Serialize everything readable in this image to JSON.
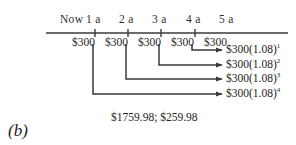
{
  "figure": {
    "panel_label": "(b)",
    "interest_rate_factor": "1.08",
    "periods": [
      {
        "label": "Now",
        "x": 60
      },
      {
        "label": "1 a",
        "x": 86
      },
      {
        "label": "2 a",
        "x": 119
      },
      {
        "label": "3 a",
        "x": 152
      },
      {
        "label": "4 a",
        "x": 186
      },
      {
        "label": "5 a",
        "x": 219
      }
    ],
    "cash_flows": [
      {
        "label": "$300",
        "x": 72
      },
      {
        "label": "$300",
        "x": 105
      },
      {
        "label": "$300",
        "x": 138
      },
      {
        "label": "$300",
        "x": 171
      },
      {
        "label": "$300",
        "x": 204
      }
    ],
    "future_values": [
      {
        "label": "$300(1.08)",
        "exponent": "1",
        "y": 50
      },
      {
        "label": "$300(1.08)",
        "exponent": "2",
        "y": 65
      },
      {
        "label": "$300(1.08)",
        "exponent": "3",
        "y": 79
      },
      {
        "label": "$300(1.08)",
        "exponent": "4",
        "y": 94
      }
    ],
    "totals": {
      "text": "$1759.98; $259.98",
      "future_value": "$1759.98",
      "interest_earned": "$259.98"
    },
    "axis": {
      "start_x": 46,
      "end_x": 288,
      "y": 33,
      "tick_xs": [
        95,
        128,
        161,
        195
      ]
    },
    "connectors": [
      {
        "from_x": 192,
        "drop_to_y": 50,
        "arrow_to_x": 222
      },
      {
        "from_x": 159,
        "drop_to_y": 65,
        "arrow_to_x": 222
      },
      {
        "from_x": 126,
        "drop_to_y": 79,
        "arrow_to_x": 222
      },
      {
        "from_x": 93,
        "drop_to_y": 94,
        "arrow_to_x": 222
      }
    ],
    "colors": {
      "ink": "#3a3a3a",
      "text": "#242424",
      "background": "#ffffff"
    }
  }
}
